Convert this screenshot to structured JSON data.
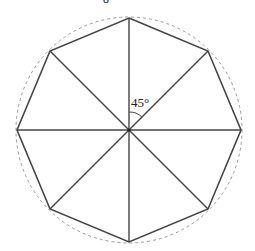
{
  "diagram": {
    "title_fragment": "8",
    "angle_label": "45°",
    "shape": "regular octagon inscribed in circle",
    "center": [
      129,
      130
    ],
    "radius": 112,
    "vertex_count": 8,
    "colors": {
      "stroke": "#444444",
      "circle": "#999999",
      "background": "#ffffff"
    }
  }
}
